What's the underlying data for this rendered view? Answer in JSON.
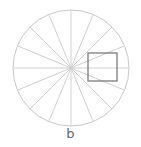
{
  "diagram": {
    "label": "b",
    "circle": {
      "cx": 71,
      "cy": 68,
      "r": 58,
      "stroke": "#c8c8c8"
    },
    "spokes": 16,
    "spoke_color": "#d0d0d0",
    "square": {
      "x": 88,
      "y": 53,
      "w": 29,
      "h": 28,
      "stroke": "#707070"
    }
  }
}
